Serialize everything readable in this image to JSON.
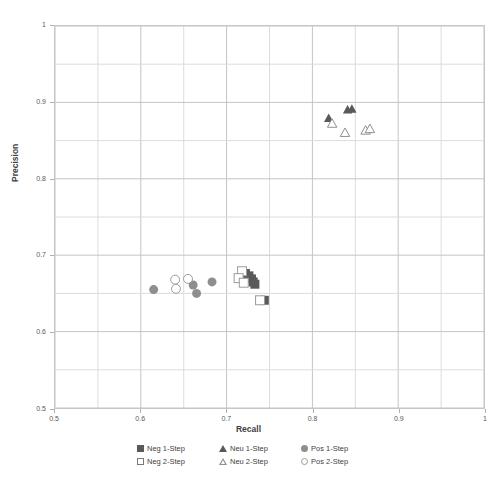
{
  "chart_data": {
    "type": "scatter",
    "title": "",
    "xlabel": "Recall",
    "ylabel": "Precision",
    "xlim": [
      0.5,
      1.0
    ],
    "ylim": [
      0.5,
      1.0
    ],
    "x_ticks": [
      "0.5",
      "0.6",
      "0.7",
      "0.8",
      "0.9",
      "1"
    ],
    "x_tick_values": [
      0.5,
      0.6,
      0.7,
      0.8,
      0.9,
      1.0
    ],
    "y_ticks": [
      "0.5",
      "0.6",
      "0.7",
      "0.8",
      "0.9",
      "1"
    ],
    "y_tick_values": [
      0.5,
      0.6,
      0.7,
      0.8,
      0.9,
      1.0
    ],
    "minor_gridline_step": 0.05,
    "grid": true,
    "legend_position": "bottom",
    "series": [
      {
        "name": "Neg 1-Step",
        "marker": "square-filled",
        "color": "#595959",
        "points": [
          [
            0.722,
            0.676
          ],
          [
            0.726,
            0.673
          ],
          [
            0.729,
            0.669
          ],
          [
            0.731,
            0.665
          ],
          [
            0.733,
            0.662
          ],
          [
            0.744,
            0.641
          ]
        ]
      },
      {
        "name": "Neg 2-Step",
        "marker": "square-hollow",
        "color": "#ffffff",
        "points": [
          [
            0.718,
            0.679
          ],
          [
            0.714,
            0.67
          ],
          [
            0.72,
            0.664
          ],
          [
            0.739,
            0.641
          ]
        ]
      },
      {
        "name": "Neu 1-Step",
        "marker": "triangle-filled",
        "color": "#595959",
        "points": [
          [
            0.819,
            0.88
          ],
          [
            0.841,
            0.891
          ],
          [
            0.846,
            0.892
          ]
        ]
      },
      {
        "name": "Neu 2-Step",
        "marker": "triangle-hollow",
        "color": "#ffffff",
        "points": [
          [
            0.823,
            0.873
          ],
          [
            0.838,
            0.861
          ],
          [
            0.862,
            0.864
          ],
          [
            0.867,
            0.866
          ]
        ]
      },
      {
        "name": "Pos 1-Step",
        "marker": "circle-filled",
        "color": "#8e8e8e",
        "points": [
          [
            0.615,
            0.655
          ],
          [
            0.661,
            0.661
          ],
          [
            0.665,
            0.65
          ],
          [
            0.683,
            0.665
          ]
        ]
      },
      {
        "name": "Pos 2-Step",
        "marker": "circle-hollow",
        "color": "#ffffff",
        "points": [
          [
            0.64,
            0.668
          ],
          [
            0.655,
            0.669
          ],
          [
            0.641,
            0.656
          ]
        ]
      }
    ]
  },
  "legend": {
    "items": [
      {
        "label": "Neg 1-Step",
        "marker": "square-filled"
      },
      {
        "label": "Neu 1-Step",
        "marker": "triangle-filled"
      },
      {
        "label": "Pos 1-Step",
        "marker": "circle-filled"
      },
      {
        "label": "Neg 2-Step",
        "marker": "square-hollow"
      },
      {
        "label": "Neu 2-Step",
        "marker": "triangle-hollow"
      },
      {
        "label": "Pos 2-Step",
        "marker": "circle-hollow"
      }
    ]
  },
  "colors": {
    "dark_marker": "#595959",
    "mid_marker": "#8e8e8e",
    "grid_major": "#c4c4c4",
    "grid_minor": "#dcdcdc",
    "frame": "#c9c9c9"
  }
}
